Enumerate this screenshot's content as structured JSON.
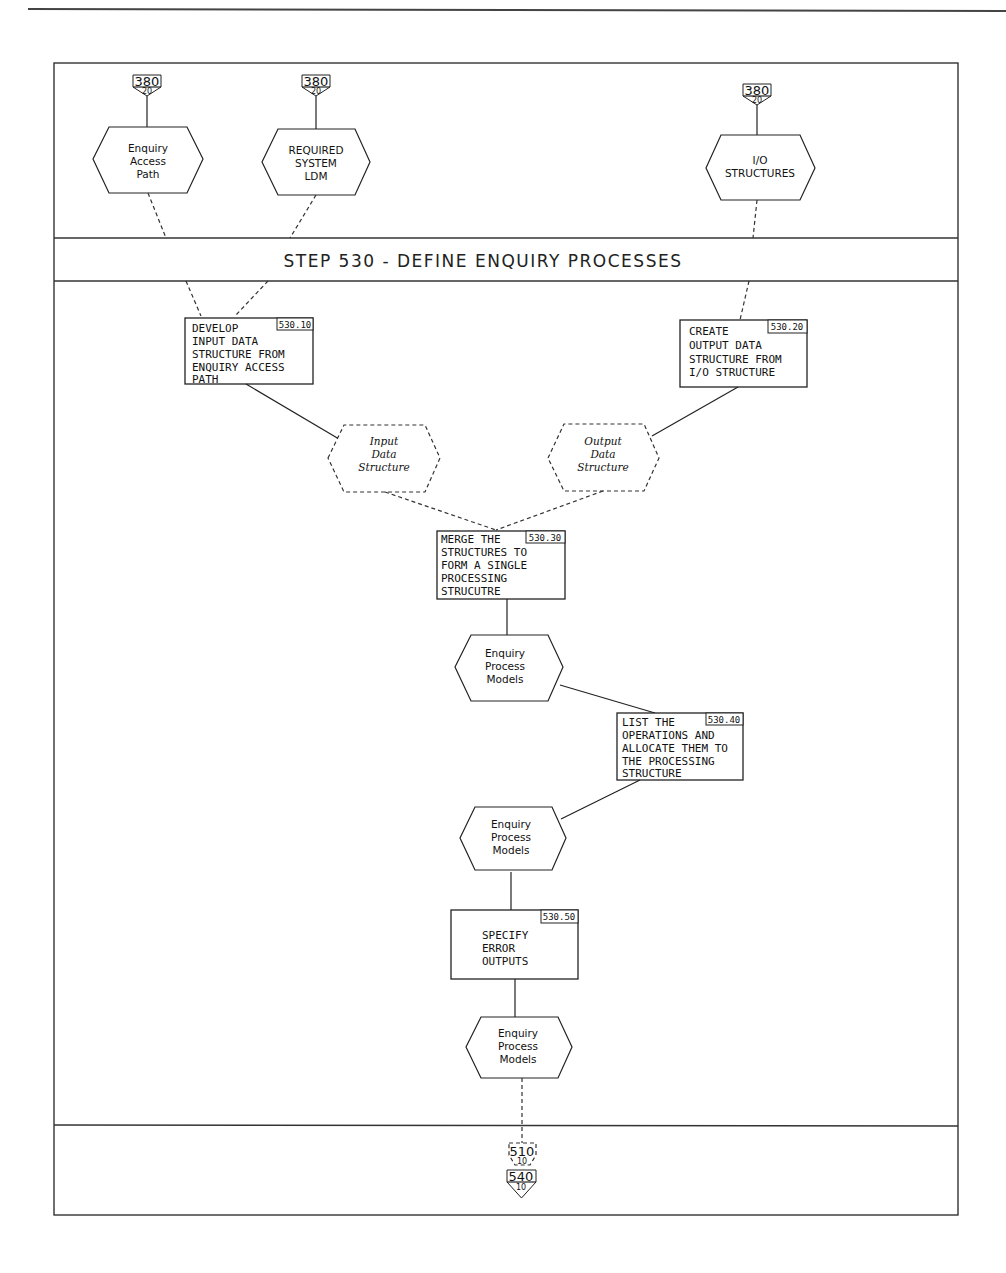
{
  "diagram": {
    "title": "STEP 530 - DEFINE ENQUIRY PROCESSES",
    "inputs": [
      {
        "id": "in1",
        "label_lines": [
          "Enquiry",
          "Access",
          "Path"
        ],
        "ref_top": "380",
        "ref_bottom": "20"
      },
      {
        "id": "in2",
        "label_lines": [
          "REQUIRED",
          "SYSTEM",
          "LDM"
        ],
        "ref_top": "380",
        "ref_bottom": "20"
      },
      {
        "id": "in3",
        "label_lines": [
          "I/O",
          "STRUCTURES"
        ],
        "ref_top": "380",
        "ref_bottom": "20"
      }
    ],
    "activities": [
      {
        "id": "530.10",
        "ref": "530.10",
        "lines": [
          "DEVELOP",
          "INPUT DATA",
          "STRUCTURE FROM",
          "ENQUIRY ACCESS",
          "PATH"
        ]
      },
      {
        "id": "530.20",
        "ref": "530.20",
        "lines": [
          "CREATE",
          "OUTPUT DATA",
          "STRUCTURE FROM",
          "I/O STRUCTURE"
        ]
      },
      {
        "id": "530.30",
        "ref": "530.30",
        "lines": [
          "MERGE THE",
          "STRUCTURES TO",
          "FORM A SINGLE",
          "PROCESSING",
          "STRUCUTRE"
        ]
      },
      {
        "id": "530.40",
        "ref": "530.40",
        "lines": [
          "LIST THE",
          "OPERATIONS AND",
          "ALLOCATE THEM TO",
          "THE PROCESSING",
          "STRUCTURE"
        ]
      },
      {
        "id": "530.50",
        "ref": "530.50",
        "lines": [
          "SPECIFY",
          "ERROR",
          "OUTPUTS"
        ]
      }
    ],
    "intermediate_products": [
      {
        "id": "ids",
        "label_lines": [
          "Input",
          "Data",
          "Structure"
        ],
        "style": "dashed-italic"
      },
      {
        "id": "ods",
        "label_lines": [
          "Output",
          "Data",
          "Structure"
        ],
        "style": "dashed-italic"
      }
    ],
    "products": [
      {
        "id": "epm1",
        "label_lines": [
          "Enquiry",
          "Process",
          "Models"
        ]
      },
      {
        "id": "epm2",
        "label_lines": [
          "Enquiry",
          "Process",
          "Models"
        ]
      },
      {
        "id": "epm3",
        "label_lines": [
          "Enquiry",
          "Process",
          "Models"
        ]
      }
    ],
    "outputs": [
      {
        "id": "out1",
        "ref_top": "510",
        "ref_bottom": "10",
        "style": "dashed"
      },
      {
        "id": "out2",
        "ref_top": "540",
        "ref_bottom": "10",
        "style": "solid"
      }
    ]
  }
}
